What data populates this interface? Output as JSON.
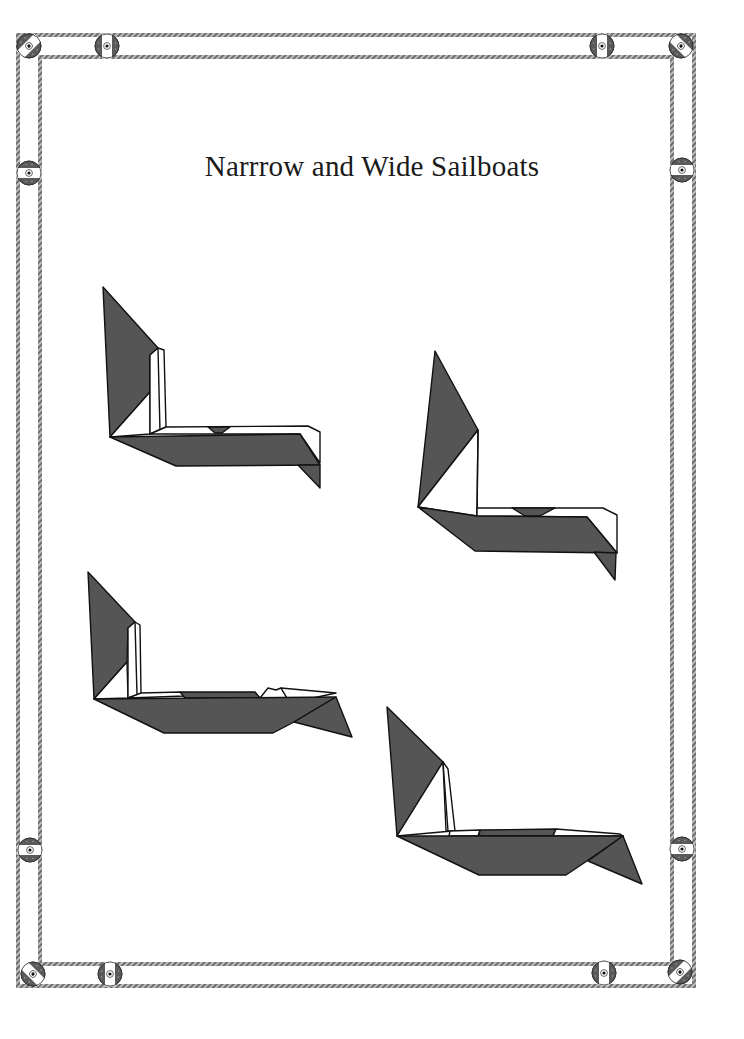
{
  "page": {
    "title": "Narrrow and Wide Sailboats"
  },
  "colors": {
    "dark_paper": "#555555",
    "light_paper": "#ffffff",
    "outline": "#111111",
    "rope": "#9a9a9a",
    "rope_dark": "#5a5a5a"
  },
  "frame": {
    "style": "rope-and-pulley border",
    "outer_rope": {
      "left": 18,
      "top": 35,
      "right": 694,
      "bottom": 985
    },
    "inner_rope": {
      "left": 40,
      "top": 57,
      "right": 672,
      "bottom": 963
    },
    "pulleys": [
      {
        "name": "corner-top-left",
        "x": 29,
        "y": 46,
        "orientation": "diagonal"
      },
      {
        "name": "top-left",
        "x": 107,
        "y": 46,
        "orientation": "vertical-band"
      },
      {
        "name": "top-right",
        "x": 602,
        "y": 46,
        "orientation": "vertical-band"
      },
      {
        "name": "corner-top-right",
        "x": 680,
        "y": 46,
        "orientation": "diagonal"
      },
      {
        "name": "left-upper",
        "x": 29,
        "y": 173,
        "orientation": "horizontal-band"
      },
      {
        "name": "right-upper",
        "x": 680,
        "y": 170,
        "orientation": "horizontal-band"
      },
      {
        "name": "left-lower",
        "x": 31,
        "y": 850,
        "orientation": "horizontal-band"
      },
      {
        "name": "right-lower",
        "x": 682,
        "y": 849,
        "orientation": "horizontal-band"
      },
      {
        "name": "corner-bottom-left",
        "x": 33,
        "y": 973,
        "orientation": "diagonal"
      },
      {
        "name": "bottom-left",
        "x": 110,
        "y": 973,
        "orientation": "vertical-band"
      },
      {
        "name": "bottom-right",
        "x": 604,
        "y": 972,
        "orientation": "vertical-band"
      },
      {
        "name": "corner-bottom-right",
        "x": 680,
        "y": 972,
        "orientation": "diagonal"
      }
    ]
  },
  "figures": [
    {
      "id": "narrow-sailboat-1",
      "label": "Narrow sailboat (tall sail)",
      "position": "upper-left"
    },
    {
      "id": "narrow-sailboat-2",
      "label": "Narrow sailboat (pointed sail)",
      "position": "upper-right"
    },
    {
      "id": "wide-sailboat-1",
      "label": "Wide sailboat",
      "position": "lower-left"
    },
    {
      "id": "wide-sailboat-2",
      "label": "Wide sailboat",
      "position": "lower-right"
    }
  ]
}
